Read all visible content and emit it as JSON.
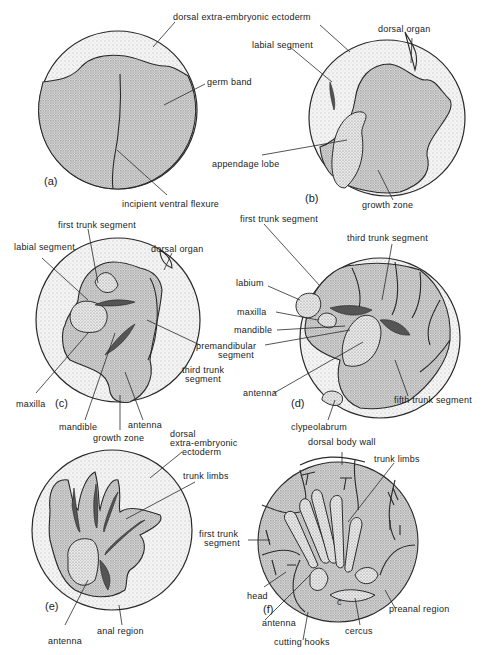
{
  "figure": {
    "panels": [
      {
        "id": "a",
        "panel_label": "(a)",
        "labels": {
          "dorsal_ectoderm": "dorsal extra-embryonic ectoderm",
          "germ_band": "germ band",
          "ventral_flexure": "incipient ventral flexure"
        }
      },
      {
        "id": "b",
        "panel_label": "(b)",
        "labels": {
          "labial_segment": "labial segment",
          "dorsal_organ": "dorsal organ",
          "appendage_lobe": "appendage lobe",
          "growth_zone": "growth zone"
        }
      },
      {
        "id": "c",
        "panel_label": "(c)",
        "labels": {
          "first_trunk_segment": "first trunk segment",
          "labial_segment": "labial segment",
          "dorsal_organ": "dorsal organ",
          "maxilla": "maxilla",
          "mandible": "mandible",
          "antenna": "antenna",
          "growth_zone": "growth zone",
          "third_trunk_segment_1": "third trunk",
          "third_trunk_segment_2": "segment"
        }
      },
      {
        "id": "d",
        "panel_label": "(d)",
        "labels": {
          "first_trunk_segment": "first trunk segment",
          "third_trunk_segment": "third trunk segment",
          "labium": "labium",
          "maxilla": "maxilla",
          "mandible": "mandible",
          "premandibular_1": "premandibular",
          "premandibular_2": "segment",
          "antenna": "antenna",
          "fifth_trunk_segment": "fifth trunk segment",
          "clypeolabrum": "clypeolabrum"
        }
      },
      {
        "id": "e",
        "panel_label": "(e)",
        "labels": {
          "dorsal_ectoderm_1": "dorsal",
          "dorsal_ectoderm_2": "extra-embryonic",
          "dorsal_ectoderm_3": "ectoderm",
          "trunk_limbs": "trunk limbs",
          "antenna": "antenna",
          "anal_region": "anal region"
        }
      },
      {
        "id": "f",
        "panel_label": "(f)",
        "labels": {
          "dorsal_body_wall": "dorsal body wall",
          "trunk_limbs": "trunk limbs",
          "first_trunk_segment_1": "first trunk",
          "first_trunk_segment_2": "segment",
          "head": "head",
          "antenna": "antenna",
          "cutting_hooks": "cutting hooks",
          "cercus": "cercus",
          "preanal_region": "preanal region",
          "cercus_mark": "c"
        }
      }
    ]
  }
}
